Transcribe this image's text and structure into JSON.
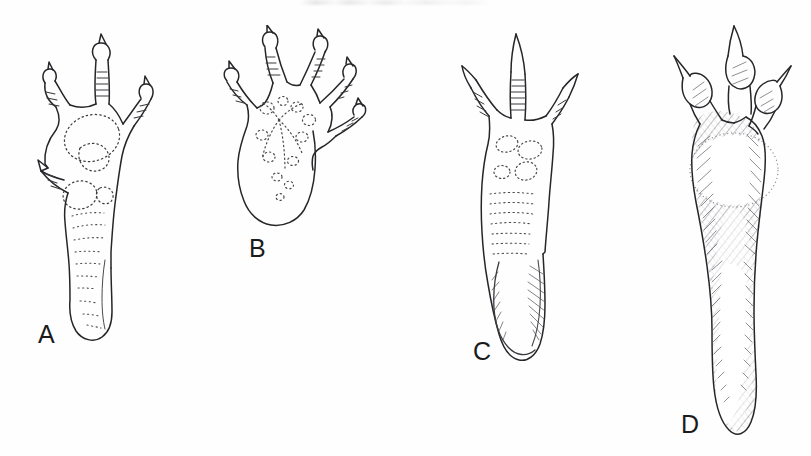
{
  "figure": {
    "kind": "scientific-line-drawing-plate",
    "medium": "pen-and-ink stipple and hatch illustration",
    "background_color": "#fefefe",
    "ink_color": "#1b1b1b",
    "panel_count": 4,
    "panels": [
      {
        "id": "A",
        "label": "A",
        "label_x": 38,
        "label_y": 322,
        "subject": "elongate foot with four clawed digits, stippled outlines of palmar pads, slender tapering sole",
        "digit_count": 4,
        "rendering": "dotted stipple outline",
        "bbox": {
          "x": 18,
          "y": 28,
          "width": 160,
          "height": 310
        }
      },
      {
        "id": "B",
        "label": "B",
        "label_x": 249,
        "label_y": 236,
        "subject": "short broad foot with five spreading clawed digits, stippled pad rosette, short wedge sole",
        "digit_count": 5,
        "rendering": "dotted stipple outline",
        "bbox": {
          "x": 212,
          "y": 30,
          "width": 145,
          "height": 200
        }
      },
      {
        "id": "C",
        "label": "C",
        "label_x": 473,
        "label_y": 339,
        "subject": "elongate foot with three sharply clawed digits, small circular pads and transverse dash rows, hatched heel",
        "digit_count": 3,
        "rendering": "dotted stipple outline with light hatching",
        "bbox": {
          "x": 448,
          "y": 28,
          "width": 140,
          "height": 330
        }
      },
      {
        "id": "D",
        "label": "D",
        "label_x": 681,
        "label_y": 412,
        "subject": "long heavily hatched foot with three clawed digits and a large pale oval metatarsal pad",
        "digit_count": 3,
        "rendering": "dense diagonal line hatching",
        "bbox": {
          "x": 655,
          "y": 24,
          "width": 156,
          "height": 420
        }
      }
    ]
  }
}
